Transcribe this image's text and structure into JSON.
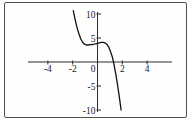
{
  "figure": {
    "frame_color": "#4f4f4f",
    "background": "#fefefe"
  },
  "chart_data": {
    "type": "line",
    "title": "",
    "xlabel": "",
    "ylabel": "",
    "xlim": [
      -5.6,
      6.0
    ],
    "ylim": [
      -10.4,
      10.4
    ],
    "grid": false,
    "legend": false,
    "axis_color": "#2b2b2b",
    "x_tick_values": [
      -4,
      -2,
      2,
      4
    ],
    "x_tick_labels": [
      "-4",
      "-2",
      "2",
      "4"
    ],
    "y_tick_values": [
      10,
      5,
      -5,
      -10
    ],
    "y_tick_labels": [
      "10",
      "5",
      "-5",
      "-10"
    ],
    "origin_label": "0",
    "series": [
      {
        "name": "cubic-curve",
        "color": "#111111",
        "points": [
          [
            -1.95,
            10.7
          ],
          [
            -1.8,
            8.8
          ],
          [
            -1.65,
            7.2
          ],
          [
            -1.5,
            5.9
          ],
          [
            -1.35,
            4.8
          ],
          [
            -1.2,
            4.1
          ],
          [
            -1.05,
            3.7
          ],
          [
            -0.9,
            3.55
          ],
          [
            -0.75,
            3.55
          ],
          [
            -0.6,
            3.6
          ],
          [
            -0.45,
            3.65
          ],
          [
            -0.3,
            3.7
          ],
          [
            -0.15,
            3.8
          ],
          [
            0.0,
            3.9
          ],
          [
            0.15,
            4.0
          ],
          [
            0.3,
            4.1
          ],
          [
            0.45,
            4.1
          ],
          [
            0.6,
            4.0
          ],
          [
            0.75,
            3.7
          ],
          [
            0.9,
            3.1
          ],
          [
            1.05,
            2.2
          ],
          [
            1.2,
            1.0
          ],
          [
            1.35,
            -0.7
          ],
          [
            1.5,
            -2.9
          ],
          [
            1.65,
            -5.4
          ],
          [
            1.8,
            -8.0
          ],
          [
            1.9,
            -10.0
          ]
        ]
      }
    ]
  }
}
